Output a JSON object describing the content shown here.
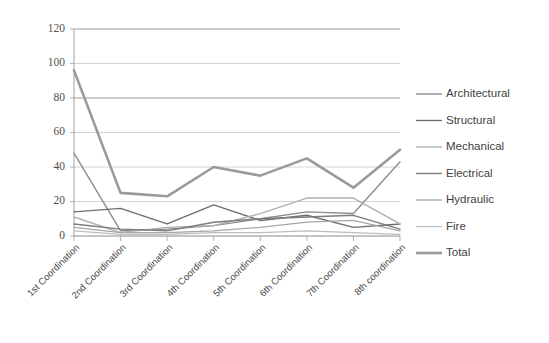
{
  "chart_data": {
    "type": "line",
    "title": "",
    "xlabel": "",
    "ylabel": "",
    "ylim": [
      0,
      120
    ],
    "ytick_step": 20,
    "yticks": [
      0,
      20,
      40,
      60,
      80,
      100,
      120
    ],
    "grid": true,
    "legend_position": "right",
    "categories": [
      "1st Coordination",
      "2nd Coordination",
      "3rd Coordination",
      "4th Coordination",
      "5th Coordination",
      "6th Coordination",
      "7th Coordination",
      "8th coordination"
    ],
    "series": [
      {
        "name": "Architectural",
        "color": "#8d8d8d",
        "width": 1.4,
        "values": [
          48,
          3,
          4,
          6,
          10,
          14,
          13,
          43
        ]
      },
      {
        "name": "Structural",
        "color": "#6f6f6f",
        "width": 1.4,
        "values": [
          14,
          16,
          7,
          18,
          9,
          12,
          5,
          7
        ]
      },
      {
        "name": "Mechanical",
        "color": "#b0b0b0",
        "width": 1.4,
        "values": [
          11,
          2,
          5,
          6,
          13,
          22,
          22,
          7
        ]
      },
      {
        "name": "Electrical",
        "color": "#7c7c7c",
        "width": 1.4,
        "values": [
          7,
          4,
          3,
          8,
          10,
          11,
          12,
          4
        ]
      },
      {
        "name": "Hydraulic",
        "color": "#a6a6a6",
        "width": 1.3,
        "values": [
          5,
          2,
          2,
          3,
          5,
          8,
          9,
          3
        ]
      },
      {
        "name": "Fire",
        "color": "#bdbdbd",
        "width": 1.2,
        "values": [
          3,
          1,
          1,
          2,
          2,
          3,
          2,
          1
        ]
      },
      {
        "name": "Total",
        "color": "#9a9a9a",
        "width": 2.6,
        "values": [
          96,
          25,
          23,
          40,
          35,
          45,
          28,
          50
        ]
      }
    ]
  },
  "axes": {
    "y_labels": [
      "120",
      "100",
      "80",
      "60",
      "40",
      "20",
      "0"
    ]
  },
  "legend": {
    "items": [
      {
        "label": "Architectural"
      },
      {
        "label": "Structural"
      },
      {
        "label": "Mechanical"
      },
      {
        "label": "Electrical"
      },
      {
        "label": "Hydraulic"
      },
      {
        "label": "Fire"
      },
      {
        "label": "Total"
      }
    ]
  }
}
